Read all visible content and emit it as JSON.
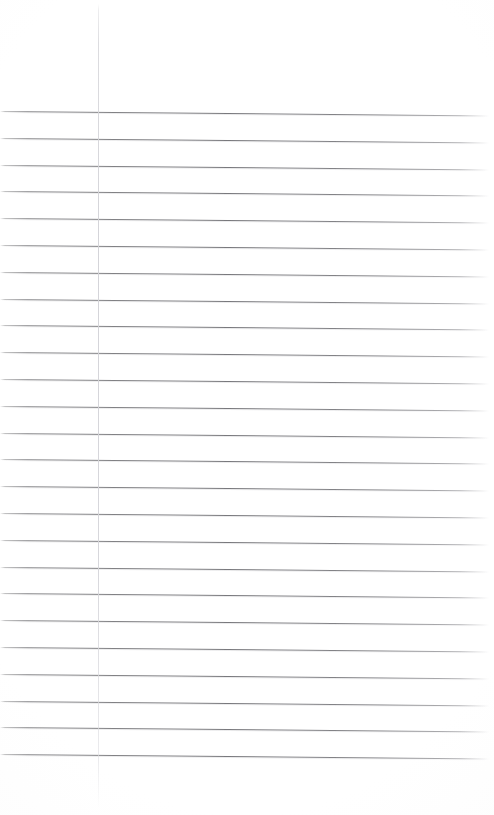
{
  "document": {
    "kind": "scanned-lined-notebook-page",
    "title": "Lined notebook page (blank)",
    "content_text": "",
    "has_handwriting": false,
    "has_printed_text": false,
    "page_width": 494,
    "page_height": 815,
    "background_color": "#ffffff",
    "rule_color": "#7c7c80",
    "margin_rule_color": "#d4d4d9"
  },
  "ruling": {
    "type": "college-ruled",
    "line_count": 25,
    "first_line_y": 111,
    "line_spacing": 26.8,
    "line_thickness": 1,
    "left_inset": 0,
    "right_extent": 489,
    "skew_degrees": 0.52,
    "description": "Evenly spaced horizontal ruled lines with slight clockwise scan skew"
  },
  "margin_rule": {
    "present": true,
    "orientation": "vertical",
    "x": 98,
    "top_y": 4,
    "bottom_y": 808,
    "thickness": 1,
    "description": "Faint vertical left margin line"
  },
  "header_area": {
    "top_blank_height": 111,
    "description": "Blank unruled header region above the first rule"
  },
  "footer_area": {
    "bottom_blank_height": 57,
    "description": "Blank unruled region below the last rule"
  }
}
